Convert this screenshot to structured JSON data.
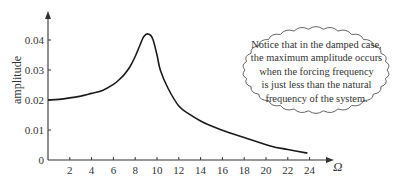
{
  "chart_data": {
    "type": "line",
    "title": "",
    "xlabel": "Ω",
    "ylabel": "amplitude",
    "xlim": [
      0,
      25
    ],
    "ylim": [
      0,
      0.045
    ],
    "grid": false,
    "x_ticks": [
      2,
      4,
      6,
      8,
      10,
      12,
      14,
      16,
      18,
      20,
      22,
      24
    ],
    "y_ticks": [
      0,
      0.01,
      0.02,
      0.03,
      0.04
    ],
    "y_tick_labels": [
      "0",
      "0.01",
      "0.02",
      "0.03",
      "0.04"
    ],
    "x_tick_labels": [
      "2",
      "4",
      "6",
      "8",
      "10",
      "12",
      "14",
      "16",
      "18",
      "20",
      "22",
      "24"
    ],
    "series": [
      {
        "name": "damped amplitude",
        "x": [
          0,
          1,
          2,
          3,
          4,
          5,
          6,
          6.6,
          7,
          7.5,
          8,
          8.4,
          8.8,
          9.2,
          9.6,
          10,
          10.3,
          11,
          12,
          13,
          14,
          15,
          16.7,
          18,
          20.4,
          22,
          23.8
        ],
        "y": [
          0.02,
          0.0202,
          0.0207,
          0.0213,
          0.0222,
          0.0232,
          0.0252,
          0.027,
          0.0285,
          0.031,
          0.0345,
          0.038,
          0.0412,
          0.042,
          0.0405,
          0.035,
          0.03,
          0.024,
          0.018,
          0.0152,
          0.013,
          0.0113,
          0.009,
          0.0075,
          0.0047,
          0.0035,
          0.0023
        ]
      }
    ],
    "annotations": [
      {
        "type": "cloud-callout",
        "text": "Notice that in the damped case, the maximum amplitude occurs when the forcing frequency is just less than the natural frequency of the system."
      }
    ]
  },
  "note": {
    "lines": [
      "Notice that in the damped case,",
      "the maximum amplitude occurs",
      "when the forcing frequency",
      "is just less than the natural",
      "frequency of the system."
    ]
  },
  "colors": {
    "curve": "#1a1a1a",
    "axis": "#333333",
    "cloud": "#555555"
  }
}
